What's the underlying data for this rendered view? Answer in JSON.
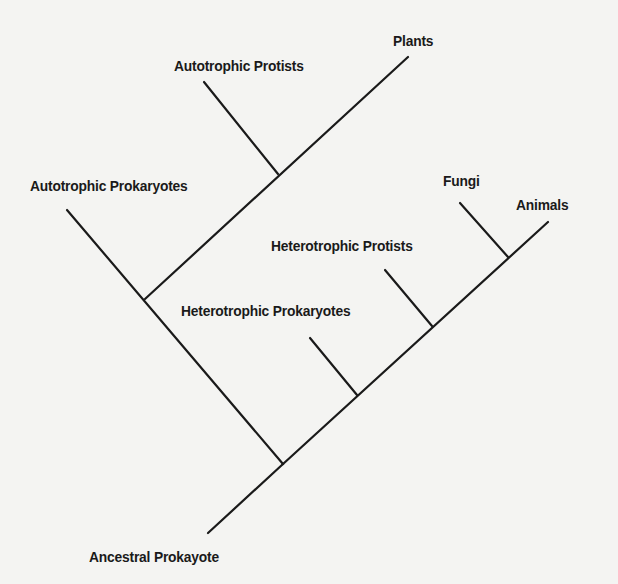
{
  "diagram": {
    "type": "cladogram",
    "root": "Ancestral Prokayote",
    "labels": {
      "plants": "Plants",
      "autotrophic_protists": "Autotrophic Protists",
      "autotrophic_prokaryotes": "Autotrophic Prokaryotes",
      "fungi": "Fungi",
      "animals": "Animals",
      "heterotrophic_protists": "Heterotrophic Protists",
      "heterotrophic_prokaryotes": "Heterotrophic Prokaryotes",
      "ancestral_prokaryote": "Ancestral Prokayote"
    },
    "tree": {
      "name": "Ancestral Prokayote",
      "children": [
        {
          "name": "autotrophic clade",
          "children": [
            {
              "name": "Autotrophic Prokaryotes"
            },
            {
              "name": "clade",
              "children": [
                {
                  "name": "Autotrophic Protists"
                },
                {
                  "name": "Plants"
                }
              ]
            }
          ]
        },
        {
          "name": "heterotrophic clade",
          "children": [
            {
              "name": "Heterotrophic Prokaryotes"
            },
            {
              "name": "clade",
              "children": [
                {
                  "name": "Heterotrophic Protists"
                },
                {
                  "name": "clade",
                  "children": [
                    {
                      "name": "Fungi"
                    },
                    {
                      "name": "Animals"
                    }
                  ]
                }
              ]
            }
          ]
        }
      ]
    },
    "line_color": "#1a1a1a",
    "background_color": "#f4f4f2"
  }
}
